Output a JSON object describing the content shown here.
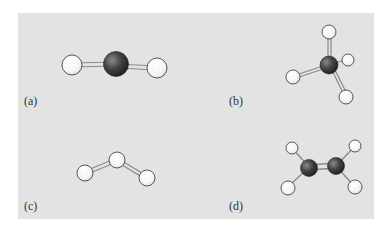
{
  "figure": {
    "background_color": "#e3e3e3",
    "panels": [
      {
        "id": "a",
        "label": "(a)",
        "molecule_shape": "linear",
        "atoms": 3
      },
      {
        "id": "b",
        "label": "(b)",
        "molecule_shape": "tetrahedral",
        "atoms": 5
      },
      {
        "id": "c",
        "label": "(c)",
        "molecule_shape": "bent",
        "atoms": 3
      },
      {
        "id": "d",
        "label": "(d)",
        "molecule_shape": "trigonal-planar (planar, double bond)",
        "atoms": 6
      }
    ],
    "colors": {
      "dark_atom": "#3a3a3a",
      "light_atom": "#f8f8f8",
      "bond": "#9a9a9a"
    }
  }
}
